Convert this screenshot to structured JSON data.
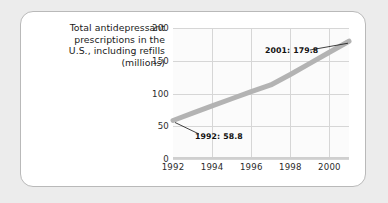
{
  "figure": {
    "caption_lines": [
      "Total antidepressant",
      "prescriptions in the",
      "U.S., including refills",
      "(millions)"
    ],
    "panel_background": "#ffffff",
    "outer_background": "#ececec",
    "border_color": "#b9b9b9"
  },
  "chart_data": {
    "type": "line",
    "title": "",
    "xlabel": "",
    "ylabel": "",
    "x": [
      1992,
      1993,
      1994,
      1995,
      1996,
      1997,
      1998,
      1999,
      2000,
      2001
    ],
    "values": [
      58.8,
      70.0,
      81.0,
      92.0,
      103.0,
      113.0,
      129.0,
      146.0,
      163.0,
      179.8
    ],
    "xlim": [
      1992,
      2001
    ],
    "ylim": [
      0,
      200
    ],
    "ytick_labels": [
      "0",
      "50",
      "100",
      "150",
      "200"
    ],
    "yticks": [
      0,
      50,
      100,
      150,
      200
    ],
    "xtick_labels": [
      "1992",
      "1994",
      "1996",
      "1998",
      "2000"
    ],
    "xticks": [
      1992,
      1994,
      1996,
      1998,
      2000
    ],
    "grid": true,
    "legend": "none",
    "line_color": "#b3b3b3",
    "line_width": 5,
    "annotations": [
      {
        "key": "start",
        "label": "1992: 58.8",
        "x": 1992,
        "y": 58.8
      },
      {
        "key": "end",
        "label": "2001: 179.8",
        "x": 2001,
        "y": 179.8
      }
    ]
  }
}
